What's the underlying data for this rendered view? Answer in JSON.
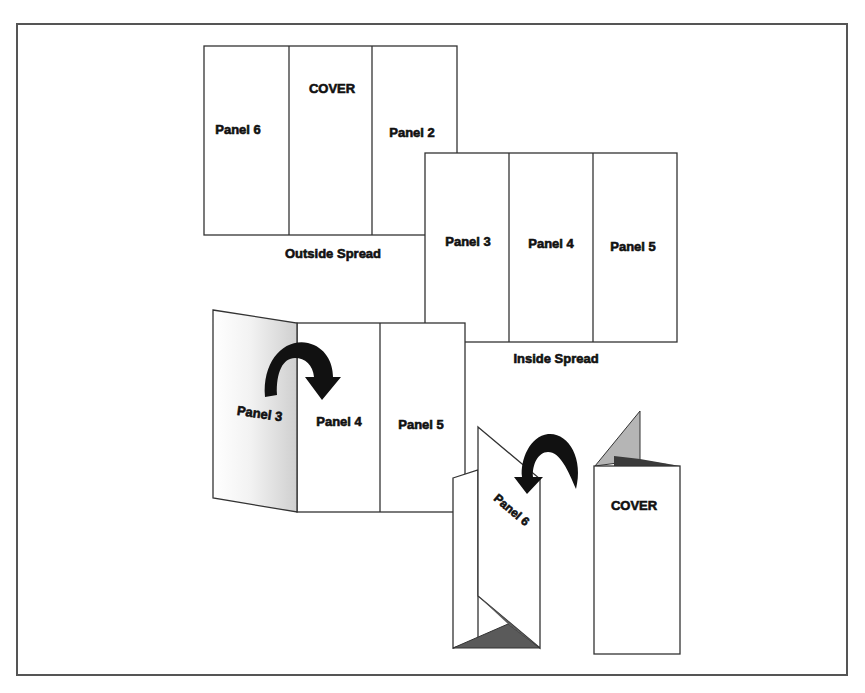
{
  "diagram": {
    "outside_spread": {
      "caption": "Outside Spread",
      "panels": [
        "Panel 6",
        "COVER",
        "Panel 2"
      ]
    },
    "inside_spread": {
      "caption": "Inside Spread",
      "panels": [
        "Panel 3",
        "Panel 4",
        "Panel 5"
      ]
    },
    "folding_inside": {
      "panels": [
        "Panel 3",
        "Panel 4",
        "Panel 5"
      ],
      "arrow": "fold-over-arrow"
    },
    "folded_brochure": {
      "inner_panel": "Panel 6",
      "front_panel": "COVER",
      "arrow": "fold-over-arrow"
    },
    "colors": {
      "line": "#333333",
      "shade_dark": "#555555",
      "shade_light": "#b5b5b5",
      "arrow": "#111111"
    }
  }
}
